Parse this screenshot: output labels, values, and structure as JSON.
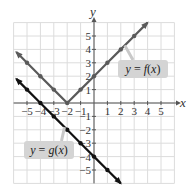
{
  "chart_data": {
    "type": "line",
    "title": "",
    "xlabel": "x",
    "ylabel": "y",
    "xlim": [
      -6,
      6
    ],
    "ylim": [
      -6,
      6
    ],
    "grid": true,
    "x_ticks": [
      -5,
      -4,
      -3,
      -2,
      -1,
      1,
      2,
      3,
      4,
      5
    ],
    "y_ticks": [
      -5,
      -4,
      -3,
      -2,
      -1,
      1,
      2,
      3,
      4,
      5
    ],
    "x_tick_labels": [
      "−5",
      "−4",
      "−3",
      "−2",
      "−1",
      "1",
      "2",
      "3",
      "4",
      "5"
    ],
    "y_tick_labels": [
      "−5",
      "−4",
      "−3",
      "−2",
      "−1",
      "1",
      "2",
      "3",
      "4",
      "5"
    ],
    "series": [
      {
        "name": "y = f(x)",
        "label": "y = f(x)",
        "expression": "|x + 2|",
        "color": "#5a5a5a",
        "x": [
          -5.8,
          -5,
          -4,
          -3,
          -2,
          -1,
          0,
          1,
          2,
          3,
          4
        ],
        "y": [
          3.8,
          3,
          2,
          1,
          0,
          1,
          2,
          3,
          4,
          5,
          6
        ],
        "points_x": [
          -5,
          -4,
          -3,
          -2,
          -1,
          0,
          1,
          2,
          3
        ],
        "points_y": [
          3,
          2,
          1,
          0,
          1,
          2,
          3,
          4,
          5
        ]
      },
      {
        "name": "y = g(x)",
        "label": "y = g(x)",
        "expression": "-x - 4",
        "color": "#111111",
        "x": [
          -5.8,
          -5,
          -4,
          -3,
          -2,
          -1,
          0,
          1,
          2
        ],
        "y": [
          1.8,
          1,
          0,
          -1,
          -2,
          -3,
          -4,
          -5,
          -6
        ],
        "points_x": [
          -5,
          -4,
          -3,
          -2,
          -1,
          0,
          1
        ],
        "points_y": [
          1,
          0,
          -1,
          -2,
          -3,
          -4,
          -5
        ]
      }
    ],
    "annotations": [
      {
        "text": "y = f(x)",
        "box_x": 118,
        "box_y": 60,
        "box_w": 50,
        "box_h": 18,
        "pointer_to": [
          2.3,
          4.3
        ]
      },
      {
        "text": "y = g(x)",
        "box_x": 24,
        "box_y": 141,
        "box_w": 50,
        "box_h": 18,
        "pointer_to": [
          -2.2,
          -1.8
        ]
      }
    ],
    "legend": "inline-callouts"
  }
}
